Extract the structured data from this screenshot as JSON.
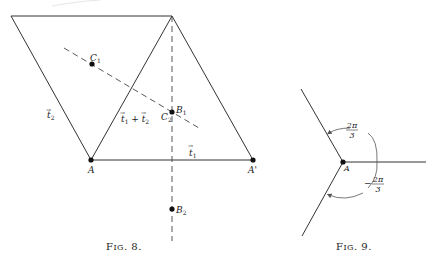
{
  "figures": [
    {
      "id": "fig8",
      "caption": "Fig. 8.",
      "caption_small": "IG",
      "caption_f": "F",
      "caption_tail": ". 8.",
      "points": {
        "A": "A",
        "A_prime": "A'",
        "B1": "B",
        "B1_sub": "1",
        "B2": "B",
        "B2_sub": "2",
        "C1": "C",
        "C1_sub": "1",
        "C2": "C",
        "C2_sub": "2"
      },
      "vectors": {
        "t1": "t",
        "t1_sub": "1",
        "t2": "t",
        "t2_sub": "2",
        "sum_a": "t",
        "sum_a_sub": "1",
        "sum_plus": " + ",
        "sum_b": "t",
        "sum_b_sub": "2",
        "arrow": "→"
      }
    },
    {
      "id": "fig9",
      "caption": "Fig. 9.",
      "caption_f": "F",
      "caption_small": "IG",
      "caption_tail": ". 9.",
      "points": {
        "A": "A"
      },
      "angles": {
        "upper_num": "2π",
        "upper_den": "3",
        "lower_sign": "−",
        "lower_num": "2π",
        "lower_den": "3"
      }
    }
  ],
  "colors": {
    "ink": "#222222",
    "background": "#ffffff"
  }
}
